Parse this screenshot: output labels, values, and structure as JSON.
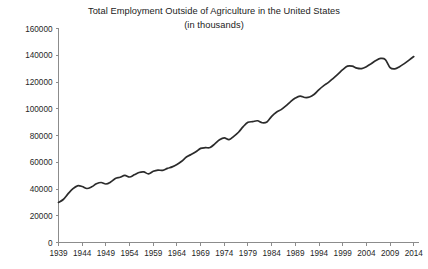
{
  "chart_data": {
    "type": "line",
    "title": "Total Employment Outside of Agriculture in the United States",
    "subtitle": "(in thousands)",
    "xlabel": "",
    "ylabel": "",
    "ylim": [
      0,
      160000
    ],
    "xlim": [
      1939,
      2015
    ],
    "grid": false,
    "legend": false,
    "yticks": [
      0,
      20000,
      40000,
      60000,
      80000,
      100000,
      120000,
      140000,
      160000
    ],
    "ytick_labels": [
      "0",
      "20000",
      "40000",
      "60000",
      "80000",
      "100000",
      "120000",
      "140000",
      "160000"
    ],
    "xticks": [
      1939,
      1944,
      1949,
      1954,
      1959,
      1964,
      1969,
      1974,
      1979,
      1984,
      1989,
      1994,
      1999,
      2004,
      2009,
      2014
    ],
    "xtick_labels": [
      "1939",
      "1944",
      "1949",
      "1954",
      "1959",
      "1964",
      "1969",
      "1974",
      "1979",
      "1984",
      "1989",
      "1994",
      "1999",
      "2004",
      "2009",
      "2014"
    ],
    "line_color": "#2b2b2b",
    "axis_color": "#8c8c8c",
    "x": [
      1939,
      1940,
      1941,
      1942,
      1943,
      1944,
      1945,
      1946,
      1947,
      1948,
      1949,
      1950,
      1951,
      1952,
      1953,
      1954,
      1955,
      1956,
      1957,
      1958,
      1959,
      1960,
      1961,
      1962,
      1963,
      1964,
      1965,
      1966,
      1967,
      1968,
      1969,
      1970,
      1971,
      1972,
      1973,
      1974,
      1975,
      1976,
      1977,
      1978,
      1979,
      1980,
      1981,
      1982,
      1983,
      1984,
      1985,
      1986,
      1987,
      1988,
      1989,
      1990,
      1991,
      1992,
      1993,
      1994,
      1995,
      1996,
      1997,
      1998,
      1999,
      2000,
      2001,
      2002,
      2003,
      2004,
      2005,
      2006,
      2007,
      2008,
      2009,
      2010,
      2011,
      2012,
      2013,
      2014
    ],
    "values": [
      29923,
      32146,
      36319,
      40063,
      42375,
      41857,
      40366,
      41619,
      43855,
      44850,
      43740,
      45175,
      47817,
      48784,
      50190,
      48990,
      50610,
      52332,
      52773,
      51342,
      53249,
      54167,
      53940,
      55418,
      56538,
      58273,
      60724,
      63894,
      65785,
      67836,
      70375,
      70873,
      71022,
      73703,
      76790,
      78258,
      76945,
      79380,
      82452,
      86635,
      89814,
      90386,
      91020,
      89544,
      90132,
      94357,
      97400,
      99329,
      102088,
      105312,
      108003,
      109485,
      108409,
      108732,
      110857,
      114342,
      117301,
      119711,
      122778,
      125938,
      129242,
      131838,
      131824,
      130344,
      130028,
      131431,
      133707,
      136098,
      137598,
      136790,
      130807,
      129877,
      131451,
      133733,
      136378,
      139043
    ]
  }
}
